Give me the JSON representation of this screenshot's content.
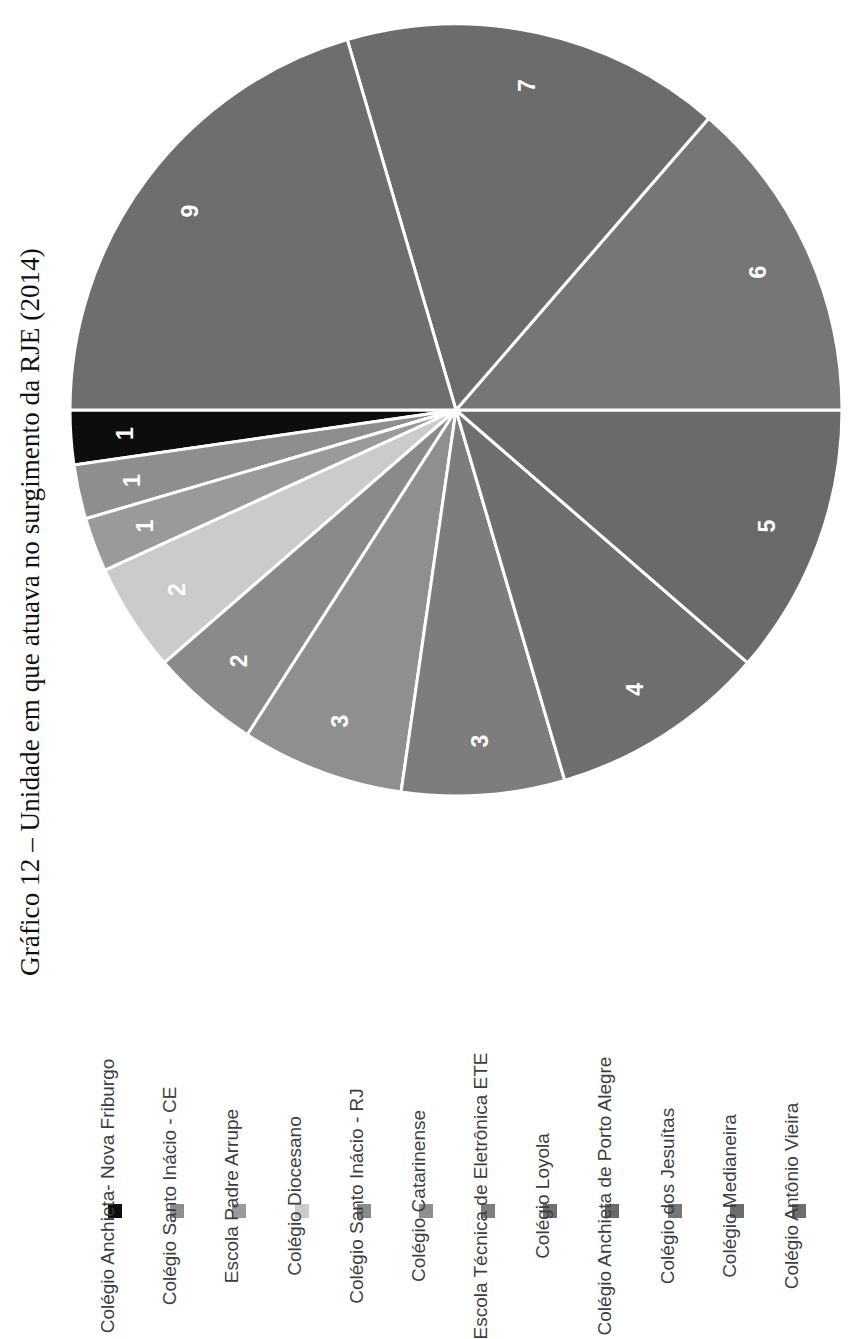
{
  "title": "Gráfico 12 – Unidade em que atuava no surgimento da RJE (2014)",
  "colors": {
    "slice_border": "#ffffff",
    "page_background": "#ffffff",
    "label_text": "#ffffff",
    "legend_text": "#3d3d3d",
    "title_text": "#111111"
  },
  "legend": {
    "items": [
      {
        "label": "Colégio Anchieta- Nova Friburgo",
        "color": "#0d0d0d"
      },
      {
        "label": "Colégio Santo Inácio - CE",
        "color": "#8e8e8e"
      },
      {
        "label": "Escola Padre Arrupe",
        "color": "#9a9a9a"
      },
      {
        "label": "Colégio Diocesano",
        "color": "#cbcbcb"
      },
      {
        "label": "Colégio Santo Inácio - RJ",
        "color": "#8a8a8a"
      },
      {
        "label": "Colégio Catarinense",
        "color": "#8f8f8f"
      },
      {
        "label": "Escola Técnica de Eletrônica ETE",
        "color": "#7d7d7d"
      },
      {
        "label": "Colégio Loyola",
        "color": "#6f6f6f"
      },
      {
        "label": "Colégio Anchieta de Porto Alegre",
        "color": "#6a6a6a"
      },
      {
        "label": "Colégio dos Jesuítas",
        "color": "#767676"
      },
      {
        "label": "Colégio Medianeira",
        "color": "#6c6c6c"
      },
      {
        "label": "Colégio Antônio Vieira",
        "color": "#6e6e6e"
      }
    ]
  },
  "chart_data": {
    "type": "pie",
    "title": "Gráfico 12 – Unidade em que atuava no surgimento da RJE (2014)",
    "xlabel": "",
    "ylabel": "",
    "total": 44,
    "legend_position": "bottom",
    "grid": false,
    "rotation_deg": -90,
    "categories": [
      "Colégio Anchieta- Nova Friburgo",
      "Colégio Santo Inácio - CE",
      "Escola Padre Arrupe",
      "Colégio Diocesano",
      "Colégio Santo Inácio - RJ",
      "Colégio Catarinense",
      "Escola Técnica de Eletrônica ETE",
      "Colégio Loyola",
      "Colégio Anchieta de Porto Alegre",
      "Colégio dos Jesuítas",
      "Colégio Medianeira",
      "Colégio Antônio Vieira"
    ],
    "values": [
      1,
      1,
      1,
      2,
      2,
      3,
      3,
      4,
      5,
      6,
      7,
      9
    ],
    "data_labels": [
      "1",
      "1",
      "1",
      "2",
      "2",
      "3",
      "3",
      "4",
      "5",
      "6",
      "7",
      "9"
    ],
    "slice_colors": [
      "#0d0d0d",
      "#8e8e8e",
      "#9a9a9a",
      "#cbcbcb",
      "#8a8a8a",
      "#8f8f8f",
      "#7d7d7d",
      "#6f6f6f",
      "#6a6a6a",
      "#767676",
      "#6c6c6c",
      "#6e6e6e"
    ]
  }
}
